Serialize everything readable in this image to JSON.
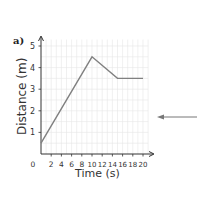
{
  "part_label": "a)",
  "chart_data": {
    "type": "line",
    "title": "",
    "xlabel": "Time (s)",
    "ylabel": "Distance (m)",
    "x_ticks": [
      0,
      2,
      4,
      6,
      8,
      10,
      12,
      14,
      16,
      18,
      20
    ],
    "x_tick_labels": [
      "0",
      "2",
      "4",
      "6",
      "8",
      "10",
      "12",
      "14",
      "16",
      "18",
      "20"
    ],
    "y_ticks": [
      1,
      2,
      3,
      4,
      5
    ],
    "y_tick_labels": [
      "1",
      "2",
      "3",
      "4",
      "5"
    ],
    "xlim": [
      0,
      21
    ],
    "ylim": [
      0,
      5.3
    ],
    "grid": true,
    "series": [
      {
        "name": "distance",
        "x": [
          0,
          10,
          15,
          20
        ],
        "y": [
          0.5,
          4.5,
          3.5,
          3.5
        ],
        "color": "#808080"
      }
    ]
  },
  "annotation": {
    "type": "arrow",
    "direction": "left",
    "color": "#777777"
  }
}
